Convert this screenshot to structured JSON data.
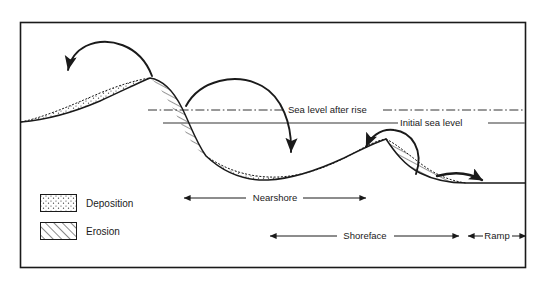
{
  "figure": {
    "type": "cross-section-diagram",
    "frame": {
      "stroke": "#1a1a1a"
    },
    "colors": {
      "ink": "#1a1a1a",
      "seabed_line": "#1a1a1a",
      "initial_sea_level_line": "#777777",
      "sea_level_after_rise_line": "#333333",
      "background": "#ffffff"
    }
  },
  "sea_levels": [
    {
      "id": "sea-level-after-rise",
      "label": "Sea level after rise",
      "line_style": "dash-dot",
      "y": 110,
      "label_x": 288,
      "label_anchor": "start"
    },
    {
      "id": "initial-sea-level",
      "label": "Initial sea level",
      "line_style": "solid",
      "y": 123,
      "label_x": 400,
      "label_anchor": "start"
    }
  ],
  "legend": {
    "items": [
      {
        "id": "deposition",
        "label": "Deposition",
        "pattern": "stipple-dots",
        "swatch": {
          "x": 40,
          "y": 194,
          "w": 36,
          "h": 17
        },
        "label_x": 86,
        "label_y": 206
      },
      {
        "id": "erosion",
        "label": "Erosion",
        "pattern": "diagonal-hatch",
        "swatch": {
          "x": 40,
          "y": 222,
          "w": 36,
          "h": 17
        },
        "label_x": 86,
        "label_y": 234
      }
    ]
  },
  "zone_scales": [
    {
      "id": "nearshore",
      "label": "Nearshore",
      "y": 198,
      "x_start": 182,
      "x_end": 368,
      "arrow_start": true,
      "arrow_end": true
    },
    {
      "id": "shoreface",
      "label": "Shoreface",
      "y": 236,
      "x_start": 268,
      "x_end": 461,
      "arrow_start": true,
      "arrow_end": true
    },
    {
      "id": "ramp",
      "label": "Ramp",
      "y": 236,
      "x_start": 466,
      "x_end": 528,
      "arrow_start": true,
      "arrow_end": true
    }
  ],
  "transport_arrows": [
    {
      "id": "transport-arrow-1",
      "direction": "landward-left",
      "description": "Curved arrow from upper shoreface crest to left deposition wedge"
    },
    {
      "id": "transport-arrow-2",
      "direction": "seaward-right-down",
      "description": "Curved arrow from first erosion zone to second deposition wedge"
    },
    {
      "id": "transport-arrow-3",
      "direction": "landward-left",
      "description": "Curved arrow from lower erosion zone up onto second deposition wedge"
    },
    {
      "id": "transport-arrow-4",
      "direction": "seaward-right",
      "description": "Arrow along the ramp pointing offshore"
    }
  ]
}
